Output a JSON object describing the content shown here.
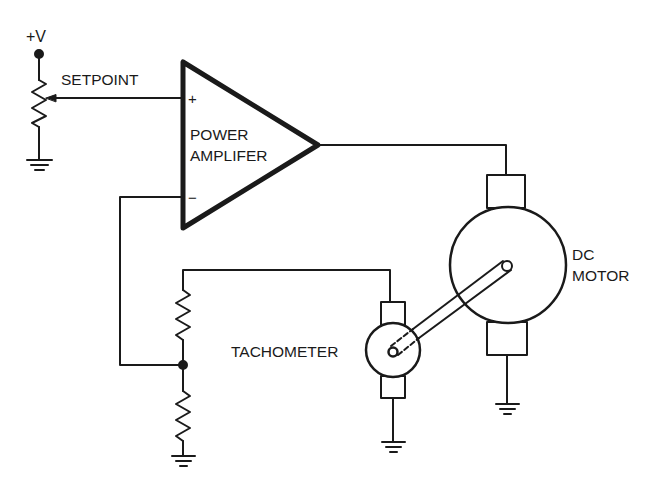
{
  "diagram": {
    "type": "schematic",
    "labels": {
      "supply": "+V",
      "setpoint": "SETPOINT",
      "amp_plus": "+",
      "amp_minus": "−",
      "amp_line1": "POWER",
      "amp_line2": "AMPLIFER",
      "motor_line1": "DC",
      "motor_line2": "MOTOR",
      "tachometer": "TACHOMETER"
    },
    "components": [
      {
        "id": "supply-terminal",
        "label": "+V"
      },
      {
        "id": "setpoint-potentiometer",
        "label": "SETPOINT"
      },
      {
        "id": "power-amplifier",
        "label": "POWER AMPLIFER"
      },
      {
        "id": "dc-motor",
        "label": "DC MOTOR"
      },
      {
        "id": "tachometer",
        "label": "TACHOMETER"
      },
      {
        "id": "feedback-divider-upper-resistor",
        "label": ""
      },
      {
        "id": "feedback-divider-lower-resistor",
        "label": ""
      },
      {
        "id": "ground-symbols",
        "count": 4
      }
    ],
    "connections": [
      [
        "setpoint-potentiometer.wiper",
        "power-amplifier.+"
      ],
      [
        "power-amplifier.out",
        "dc-motor.top-brush"
      ],
      [
        "dc-motor.bottom-brush",
        "ground"
      ],
      [
        "dc-motor.shaft",
        "tachometer.shaft"
      ],
      [
        "tachometer.top-brush",
        "feedback-divider.top"
      ],
      [
        "tachometer.bottom-brush",
        "ground"
      ],
      [
        "feedback-divider.midpoint",
        "power-amplifier.-"
      ],
      [
        "feedback-divider.bottom",
        "ground"
      ]
    ],
    "colors": {
      "ink": "#1a1a1a",
      "background": "#ffffff"
    }
  }
}
